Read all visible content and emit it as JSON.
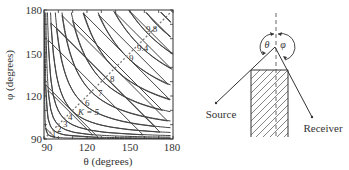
{
  "chart_data": {
    "type": "contour",
    "xlabel": "θ (degrees)",
    "ylabel": "φ (degrees)",
    "xlim": [
      90,
      180
    ],
    "ylim": [
      90,
      180
    ],
    "xticks": [
      "90",
      "120",
      "150",
      "180"
    ],
    "yticks": [
      "90",
      "120",
      "150",
      "180"
    ],
    "contour_levels": [
      "1",
      "2",
      "3",
      "4",
      "K = 5",
      "6",
      "7",
      "8",
      "9",
      "9.4",
      "9.8"
    ],
    "diagonal_line": "dashed θ = φ",
    "grid": false
  },
  "diagram": {
    "angle_left": "θ",
    "angle_right": "φ",
    "source_label": "Source",
    "receiver_label": "Receiver"
  }
}
